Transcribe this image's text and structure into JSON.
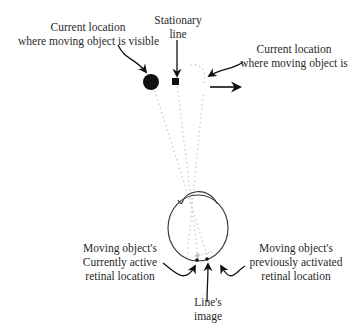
{
  "labels": {
    "visible_location": {
      "line1": "Current location",
      "line2": "where moving object is visible"
    },
    "stationary_line": {
      "line1": "Stationary",
      "line2": "line"
    },
    "invisible_location": {
      "line1": "Current location",
      "line2": "where moving object is"
    },
    "active_retinal": {
      "line1": "Moving object's",
      "line2": "Currently active",
      "line3": "retinal location"
    },
    "line_image": {
      "line1": "Line's",
      "line2": "image"
    },
    "previous_retinal": {
      "line1": "Moving object's",
      "line2": "previously activated",
      "line3": "retinal location"
    }
  },
  "colors": {
    "ink": "#111111",
    "dotted": "#c8c8c8",
    "text": "#2a2a2a"
  }
}
